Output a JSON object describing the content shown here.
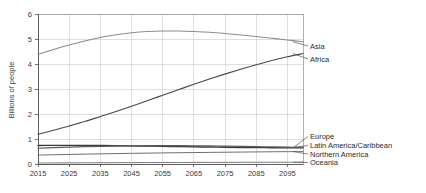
{
  "chart_data": {
    "type": "line",
    "title": "",
    "subtitle": "",
    "xlabel": "",
    "ylabel": "Billions of people",
    "xlim": [
      2015,
      2100
    ],
    "ylim": [
      0,
      6
    ],
    "grid": true,
    "legend_position": "right-inline-labels",
    "x_ticks": [
      "2015",
      "2025",
      "2035",
      "2045",
      "2055",
      "2065",
      "2075",
      "2085",
      "2095"
    ],
    "x_tick_values": [
      2015,
      2025,
      2035,
      2045,
      2055,
      2065,
      2075,
      2085,
      2095
    ],
    "y_ticks": [
      "0",
      "1",
      "2",
      "3",
      "4",
      "5",
      "6"
    ],
    "y_tick_values": [
      0,
      1,
      2,
      3,
      4,
      5,
      6
    ],
    "x": [
      2015,
      2020,
      2025,
      2030,
      2035,
      2040,
      2045,
      2050,
      2055,
      2060,
      2065,
      2070,
      2075,
      2080,
      2085,
      2090,
      2095,
      2100
    ],
    "series": [
      {
        "name": "Asia",
        "color": "#8c8c8c",
        "width": 1.1,
        "values": [
          4.39,
          4.58,
          4.76,
          4.92,
          5.06,
          5.17,
          5.25,
          5.3,
          5.32,
          5.32,
          5.3,
          5.27,
          5.22,
          5.16,
          5.1,
          5.03,
          4.96,
          4.89
        ]
      },
      {
        "name": "Africa",
        "color": "#4a4a4a",
        "width": 1.2,
        "values": [
          1.19,
          1.35,
          1.52,
          1.7,
          1.9,
          2.1,
          2.31,
          2.53,
          2.75,
          2.97,
          3.19,
          3.4,
          3.6,
          3.79,
          3.97,
          4.14,
          4.29,
          4.42
        ]
      },
      {
        "name": "Europe",
        "color": "#3c3c3c",
        "width": 1.4,
        "values": [
          0.74,
          0.745,
          0.746,
          0.744,
          0.74,
          0.734,
          0.726,
          0.717,
          0.707,
          0.697,
          0.687,
          0.678,
          0.67,
          0.663,
          0.657,
          0.652,
          0.648,
          0.646
        ]
      },
      {
        "name": "Latin America/Caribbean",
        "color": "#5a5a5a",
        "width": 1.2,
        "values": [
          0.63,
          0.653,
          0.674,
          0.692,
          0.707,
          0.718,
          0.726,
          0.731,
          0.733,
          0.732,
          0.728,
          0.722,
          0.714,
          0.705,
          0.695,
          0.684,
          0.673,
          0.661
        ]
      },
      {
        "name": "Northern America",
        "color": "#6e6e6e",
        "width": 1.0,
        "values": [
          0.357,
          0.37,
          0.383,
          0.395,
          0.406,
          0.416,
          0.426,
          0.435,
          0.443,
          0.451,
          0.458,
          0.465,
          0.471,
          0.477,
          0.483,
          0.489,
          0.494,
          0.5
        ]
      },
      {
        "name": "Oceania",
        "color": "#7a7a7a",
        "width": 1.0,
        "values": [
          0.039,
          0.042,
          0.045,
          0.048,
          0.05,
          0.053,
          0.055,
          0.057,
          0.059,
          0.061,
          0.063,
          0.064,
          0.066,
          0.067,
          0.069,
          0.07,
          0.071,
          0.072
        ]
      }
    ],
    "annotations": [
      {
        "text": "Asia",
        "x": 2100,
        "y": 4.89
      },
      {
        "text": "Africa",
        "x": 2100,
        "y": 4.42
      },
      {
        "text": "Europe",
        "x": 2100,
        "y": 0.646
      },
      {
        "text": "Latin America/Caribbean",
        "x": 2100,
        "y": 0.661
      },
      {
        "text": "Northern America",
        "x": 2100,
        "y": 0.5
      },
      {
        "text": "Oceania",
        "x": 2100,
        "y": 0.072
      }
    ]
  }
}
